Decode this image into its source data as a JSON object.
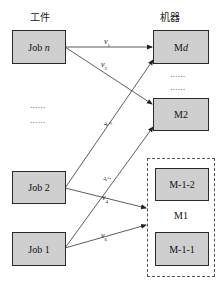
{
  "headers": {
    "jobs": "工件",
    "machines": "机器"
  },
  "jobs": [
    {
      "id": "job-n",
      "prefix": "Job ",
      "suffix": "n"
    },
    {
      "id": "job-2",
      "label": "Job 2"
    },
    {
      "id": "job-1",
      "label": "Job 1"
    }
  ],
  "machines": [
    {
      "id": "md",
      "prefix": "M",
      "suffix": "d"
    },
    {
      "id": "m2",
      "label": "M2"
    }
  ],
  "group": {
    "label": "M1",
    "members": [
      {
        "id": "m-1-2",
        "label": "M-1-2"
      },
      {
        "id": "m-1-1",
        "label": "M-1-1"
      }
    ]
  },
  "ellipsis": "......",
  "edges": [
    {
      "from": "Job n",
      "to": "Md",
      "label": "v",
      "sub": "1"
    },
    {
      "from": "Job n",
      "to": "M2",
      "label": "v",
      "sub": "2"
    },
    {
      "from": "Job 2",
      "to": "Md",
      "label": "v",
      "sub": "3"
    },
    {
      "from": "Job 2",
      "to": "M1",
      "label": "v",
      "sub": "4"
    },
    {
      "from": "Job 1",
      "to": "M2",
      "label": "v",
      "sub": "5"
    },
    {
      "from": "Job 1",
      "to": "M1",
      "label": "v",
      "sub": "6"
    }
  ],
  "colors": {
    "box_fill": "#cfcfcf",
    "box_border": "#2a2a2a",
    "line": "#333333"
  }
}
